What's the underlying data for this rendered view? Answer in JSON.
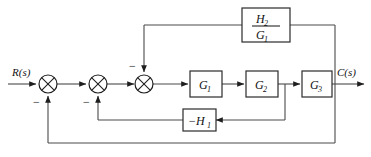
{
  "diagram": {
    "type": "control-system-block-diagram",
    "background_color": "#ffffff",
    "line_color": "#4a4a4a",
    "text_color": "#111111",
    "input_label": "R(s)",
    "output_label": "C(s)",
    "blocks": [
      {
        "id": "g1",
        "label": "G",
        "subscript": "1"
      },
      {
        "id": "g2",
        "label": "G",
        "subscript": "2"
      },
      {
        "id": "g3",
        "label": "G",
        "subscript": "3"
      },
      {
        "id": "h1",
        "label": "−H",
        "subscript": "1"
      },
      {
        "id": "h2_over_g1",
        "numerator": "H",
        "numerator_sub": "2",
        "denominator": "G",
        "denominator_sub": "1"
      }
    ],
    "summing_junctions": [
      {
        "id": "sum1",
        "sign": "−"
      },
      {
        "id": "sum2",
        "sign": "−"
      },
      {
        "id": "sum3",
        "sign": "−"
      }
    ]
  }
}
